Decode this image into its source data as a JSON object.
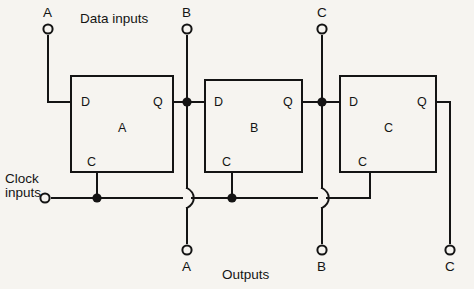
{
  "figure": {
    "background_color": "#f6f4f0",
    "line_color": "#141414"
  },
  "groups": {
    "data_inputs": "Data inputs",
    "clock_inputs_line1": "Clock",
    "clock_inputs_line2": "inputs",
    "outputs": "Outputs"
  },
  "input_terminals": [
    {
      "name": "data-input-a",
      "label": "A",
      "x": 48,
      "y": 29
    },
    {
      "name": "data-input-b",
      "label": "B",
      "x": 187,
      "y": 29
    },
    {
      "name": "data-input-c",
      "label": "C",
      "x": 322,
      "y": 29
    }
  ],
  "clock_terminal": {
    "name": "clock-input",
    "label": "",
    "x": 45,
    "y": 198
  },
  "output_terminals": [
    {
      "name": "output-a",
      "label": "A",
      "x": 187,
      "y": 250
    },
    {
      "name": "output-b",
      "label": "B",
      "x": 322,
      "y": 250
    },
    {
      "name": "output-c",
      "label": "C",
      "x": 450,
      "y": 250
    }
  ],
  "flipflops": [
    {
      "id": "A",
      "name": "flipflop-a",
      "box_label": "A",
      "pins": {
        "d": "D",
        "q": "Q",
        "c": "C"
      },
      "x": 71,
      "y": 76,
      "w": 102,
      "h": 96
    },
    {
      "id": "B",
      "name": "flipflop-b",
      "box_label": "B",
      "pins": {
        "d": "D",
        "q": "Q",
        "c": "C"
      },
      "x": 205,
      "y": 80,
      "w": 97,
      "h": 92
    },
    {
      "id": "C",
      "name": "flipflop-c",
      "box_label": "C",
      "pins": {
        "d": "D",
        "q": "Q",
        "c": "C"
      },
      "x": 340,
      "y": 76,
      "w": 96,
      "h": 96
    }
  ],
  "junction_dots": [
    {
      "name": "junction-q-a",
      "x": 187,
      "y": 102
    },
    {
      "name": "junction-q-b",
      "x": 322,
      "y": 102
    },
    {
      "name": "junction-clock-a",
      "x": 97,
      "y": 198
    },
    {
      "name": "junction-clock-b",
      "x": 232,
      "y": 198
    }
  ],
  "wire_hops": [
    {
      "name": "wire-hop-output-a",
      "x": 187,
      "y": 198
    },
    {
      "name": "wire-hop-output-b",
      "x": 322,
      "y": 198
    }
  ]
}
